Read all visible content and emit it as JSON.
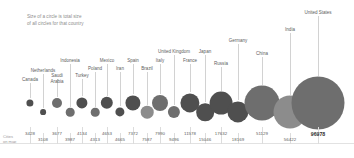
{
  "annotation": {
    "text": "Size of a circle is  total size\nof all circles for that country"
  },
  "axis": {
    "title": "Cities\non map"
  },
  "colors": {
    "bubble_dark": "#4f4f4f",
    "bubble_mid": "#6e6e6e",
    "bubble_light": "#8c8c8c",
    "leader": "#d2d2d2",
    "label": "#5c5c5c",
    "note": "#8d8d8d",
    "highlight": "#2e2e2e"
  },
  "chart_data": {
    "type": "bar",
    "title": "",
    "subtitle": "Size of a circle is  total size of all circles for that country",
    "xlabel": "Cities on map",
    "ylabel": "",
    "grid": false,
    "legend": "none",
    "categories": [
      "Canada",
      "Netherlands",
      "Saudi Arabia",
      "Indonesia",
      "Turkey",
      "Poland",
      "Mexico",
      "Iran",
      "Spain",
      "Brazil",
      "Italy",
      "United Kingdom",
      "France",
      "Japan",
      "Russia",
      "Germany",
      "China",
      "India",
      "United States"
    ],
    "values": [
      3428,
      3108,
      3677,
      3987,
      4134,
      4313,
      4653,
      4665,
      7372,
      7587,
      7990,
      9496,
      11578,
      15046,
      17632,
      18169,
      51129,
      56422,
      96978
    ],
    "value_labels": [
      "3428",
      "3108",
      "3677",
      "3987",
      "4134",
      "4313",
      "4653",
      "4665",
      "7372",
      "7587",
      "7990",
      "9496",
      "11578",
      "15046",
      "17632",
      "18169",
      "51129",
      "56422",
      "96978"
    ],
    "points": [
      {
        "label": "Canada",
        "value": 3428,
        "value_text": "3428",
        "x": 30,
        "row": "bottom",
        "r": 3.6,
        "shade": "bubble_dark",
        "label_y": 77,
        "label_x": 30
      },
      {
        "label": "Netherlands",
        "value": 3108,
        "value_text": "3108",
        "x": 43,
        "row": "bottom2",
        "r": 2.9,
        "shade": "bubble_dark",
        "label_y": 68,
        "label_x": 43
      },
      {
        "label": "Saudi\nArabia",
        "value": 3677,
        "value_text": "3677",
        "x": 57,
        "row": "bottom",
        "r": 5.0,
        "shade": "bubble_mid",
        "label_y": 73,
        "label_x": 57
      },
      {
        "label": "Indonesia",
        "value": 3987,
        "value_text": "3987",
        "x": 70,
        "row": "bottom2",
        "r": 4.3,
        "shade": "bubble_mid",
        "label_y": 58,
        "label_x": 70
      },
      {
        "label": "Turkey",
        "value": 4134,
        "value_text": "4134",
        "x": 82,
        "row": "bottom",
        "r": 5.6,
        "shade": "bubble_dark",
        "label_y": 73,
        "label_x": 82
      },
      {
        "label": "Poland",
        "value": 4313,
        "value_text": "4313",
        "x": 95,
        "row": "bottom2",
        "r": 4.3,
        "shade": "bubble_mid",
        "label_y": 66,
        "label_x": 95
      },
      {
        "label": "Mexico",
        "value": 4653,
        "value_text": "4653",
        "x": 107,
        "row": "bottom",
        "r": 6.2,
        "shade": "bubble_dark",
        "label_y": 58,
        "label_x": 107
      },
      {
        "label": "Iran",
        "value": 4665,
        "value_text": "4665",
        "x": 120,
        "row": "bottom2",
        "r": 4.6,
        "shade": "bubble_dark",
        "label_y": 66,
        "label_x": 120
      },
      {
        "label": "Spain",
        "value": 7372,
        "value_text": "7372",
        "x": 133,
        "row": "bottom",
        "r": 7.6,
        "shade": "bubble_dark",
        "label_y": 58,
        "label_x": 133
      },
      {
        "label": "Brazil",
        "value": 7587,
        "value_text": "7587",
        "x": 147,
        "row": "bottom2",
        "r": 6.3,
        "shade": "bubble_light",
        "label_y": 66,
        "label_x": 147
      },
      {
        "label": "Italy",
        "value": 7990,
        "value_text": "7990",
        "x": 160,
        "row": "bottom",
        "r": 8.0,
        "shade": "bubble_mid",
        "label_y": 58,
        "label_x": 160
      },
      {
        "label": "United Kingdom",
        "value": 9496,
        "value_text": "9496",
        "x": 174,
        "row": "bottom2",
        "r": 6.1,
        "shade": "bubble_mid",
        "label_y": 49,
        "label_x": 174
      },
      {
        "label": "France",
        "value": 11578,
        "value_text": "11578",
        "x": 190,
        "row": "bottom",
        "r": 9.6,
        "shade": "bubble_dark",
        "label_y": 58,
        "label_x": 190
      },
      {
        "label": "Japan",
        "value": 15046,
        "value_text": "15046",
        "x": 205,
        "row": "bottom2",
        "r": 8.8,
        "shade": "bubble_dark",
        "label_y": 49,
        "label_x": 205
      },
      {
        "label": "Russia",
        "value": 17632,
        "value_text": "17632",
        "x": 221,
        "row": "bottom",
        "r": 11.4,
        "shade": "bubble_dark",
        "label_y": 61,
        "label_x": 221
      },
      {
        "label": "Germany",
        "value": 18169,
        "value_text": "18169",
        "x": 238,
        "row": "bottom2",
        "r": 10.6,
        "shade": "bubble_dark",
        "label_y": 38,
        "label_x": 238
      },
      {
        "label": "China",
        "value": 51129,
        "value_text": "51129",
        "x": 262,
        "row": "bottom",
        "r": 17.5,
        "shade": "bubble_mid",
        "label_y": 51,
        "label_x": 262
      },
      {
        "label": "India",
        "value": 56422,
        "value_text": "56422",
        "x": 290,
        "row": "bottom2",
        "r": 16.5,
        "shade": "bubble_light",
        "label_y": 27,
        "label_x": 290
      },
      {
        "label": "United States",
        "value": 96978,
        "value_text": "96978",
        "x": 318,
        "row": "bottom",
        "r": 26.5,
        "shade": "bubble_mid",
        "label_y": 10,
        "label_x": 318
      }
    ]
  }
}
